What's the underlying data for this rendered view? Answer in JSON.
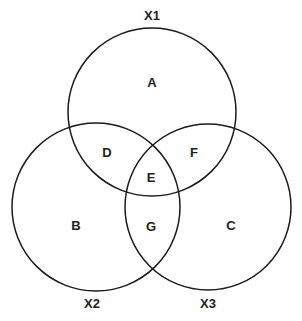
{
  "diagram": {
    "type": "venn",
    "sets": [
      {
        "id": "X1",
        "label": "X1",
        "cx": 152,
        "cy": 112,
        "r": 84,
        "label_x": 152,
        "label_y": 20
      },
      {
        "id": "X2",
        "label": "X2",
        "cx": 96,
        "cy": 207,
        "r": 84,
        "label_x": 92,
        "label_y": 308
      },
      {
        "id": "X3",
        "label": "X3",
        "cx": 208,
        "cy": 207,
        "r": 83,
        "label_x": 208,
        "label_y": 308
      }
    ],
    "regions": [
      {
        "label": "A",
        "x": 152,
        "y": 87,
        "in": [
          "X1"
        ]
      },
      {
        "label": "B",
        "x": 76,
        "y": 230,
        "in": [
          "X2"
        ]
      },
      {
        "label": "C",
        "x": 231,
        "y": 230,
        "in": [
          "X3"
        ]
      },
      {
        "label": "D",
        "x": 107,
        "y": 157,
        "in": [
          "X1",
          "X2"
        ]
      },
      {
        "label": "E",
        "x": 151,
        "y": 182,
        "in": [
          "X1",
          "X2",
          "X3"
        ]
      },
      {
        "label": "F",
        "x": 194,
        "y": 157,
        "in": [
          "X1",
          "X3"
        ]
      },
      {
        "label": "G",
        "x": 151,
        "y": 231,
        "in": [
          "X2",
          "X3"
        ]
      }
    ],
    "stroke_color": "#1a1a1a"
  }
}
